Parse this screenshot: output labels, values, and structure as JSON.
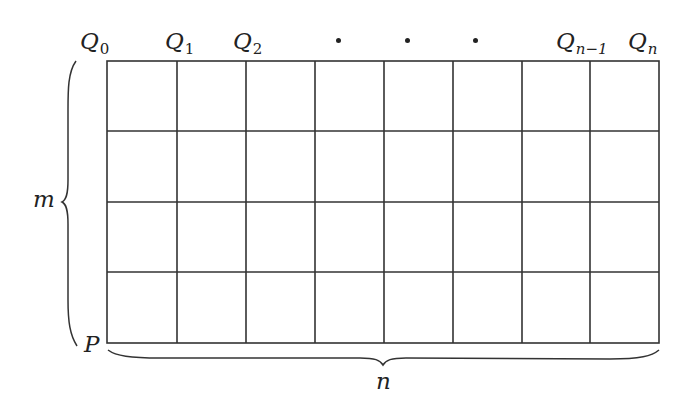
{
  "diagram": {
    "type": "lattice-grid",
    "columns": 8,
    "rows": 4,
    "line_color": "#333333",
    "top_labels": [
      {
        "base": "Q",
        "sub": "0",
        "x": 80
      },
      {
        "base": "Q",
        "sub": "1",
        "x": 165
      },
      {
        "base": "Q",
        "sub": "2",
        "x": 233
      },
      {
        "base": "Q",
        "sub": "n−1",
        "x": 556
      },
      {
        "base": "Q",
        "sub": "n",
        "x": 628
      }
    ],
    "ellipsis_dots": [
      338,
      408,
      474
    ],
    "corner_label": "P",
    "left_brace_label": "m",
    "bottom_brace_label": "n"
  }
}
